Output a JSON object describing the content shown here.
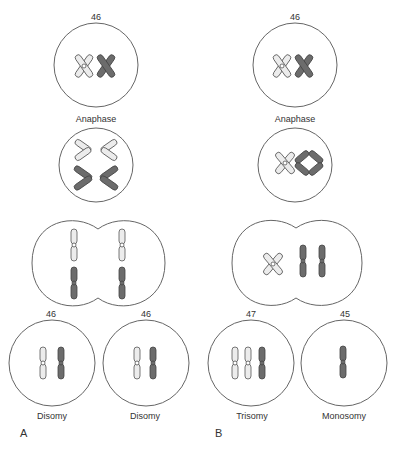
{
  "figure": {
    "colors": {
      "outline": "#555555",
      "light_chromosome": "#e8e8e8",
      "dark_chromosome": "#6e6e6e",
      "cell_stroke": "#666666"
    }
  },
  "panel_a": {
    "label": "A",
    "top_cell": {
      "count": "46",
      "caption": "Anaphase"
    },
    "bottom_cells": [
      {
        "count": "46",
        "caption": "Disomy"
      },
      {
        "count": "46",
        "caption": "Disomy"
      }
    ]
  },
  "panel_b": {
    "label": "B",
    "top_cell": {
      "count": "46",
      "caption": "Anaphase"
    },
    "bottom_cells": [
      {
        "count": "47",
        "caption": "Trisomy"
      },
      {
        "count": "45",
        "caption": "Monosomy"
      }
    ]
  }
}
